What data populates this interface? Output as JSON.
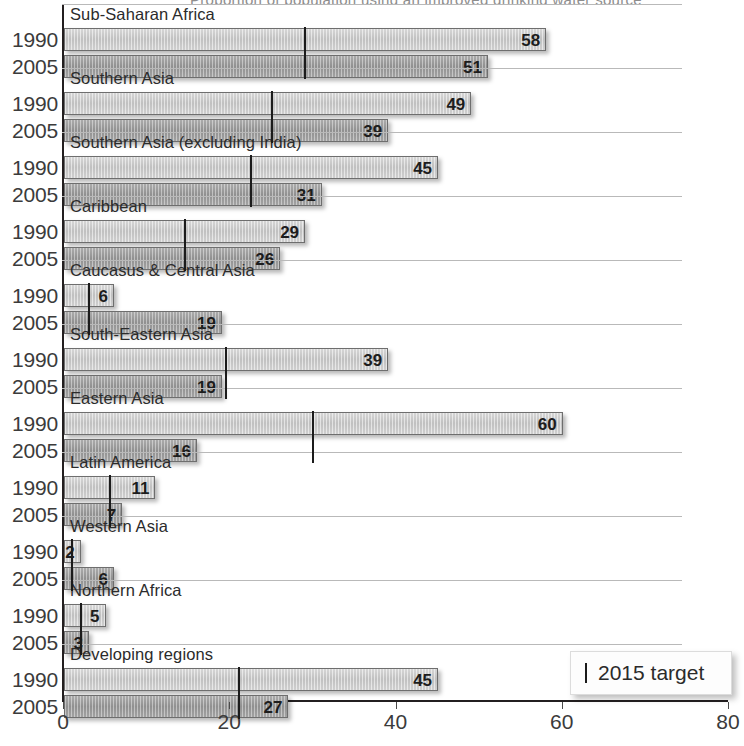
{
  "clipped_header": "Proportion of population using an improved drinking water source",
  "legend": {
    "marker_name": "target-marker",
    "label": "2015 target"
  },
  "axis": {
    "ticks": [
      0,
      20,
      40,
      60,
      80
    ],
    "tick_labels": [
      "0",
      "20",
      "40",
      "60",
      "80"
    ],
    "min": 0,
    "max": 80
  },
  "series_labels": {
    "first": "1990",
    "second": "2005"
  },
  "chart_data": {
    "type": "bar",
    "orientation": "horizontal",
    "title": "",
    "xlabel": "",
    "ylabel": "",
    "xlim": [
      0,
      80
    ],
    "grid": false,
    "legend_position": "bottom-right",
    "categories": [
      "Sub-Saharan Africa",
      "Southern Asia",
      "Southern Asia (excluding India)",
      "Caribbean",
      "Caucasus & Central Asia",
      "South-Eastern Asia",
      "Eastern Asia",
      "Latin America",
      "Western Asia",
      "Northern Africa",
      "Developing regions"
    ],
    "series": [
      {
        "name": "1990",
        "values": [
          58,
          49,
          45,
          29,
          6,
          39,
          60,
          11,
          2,
          5,
          45
        ]
      },
      {
        "name": "2005",
        "values": [
          51,
          39,
          31,
          26,
          19,
          19,
          16,
          7,
          6,
          3,
          27
        ]
      }
    ],
    "targets": {
      "name": "2015 target",
      "values": [
        29,
        25,
        22.5,
        14.5,
        3,
        19.5,
        30,
        5.5,
        1,
        2,
        21
      ]
    }
  },
  "groups": [
    {
      "title": "Sub-Saharan Africa",
      "target": 29,
      "rows": [
        {
          "label": "1990",
          "value": 58,
          "series": "y1990"
        },
        {
          "label": "2005",
          "value": 51,
          "series": "y2005"
        }
      ]
    },
    {
      "title": "Southern Asia",
      "target": 25,
      "rows": [
        {
          "label": "1990",
          "value": 49,
          "series": "y1990"
        },
        {
          "label": "2005",
          "value": 39,
          "series": "y2005"
        }
      ]
    },
    {
      "title": "Southern Asia (excluding India)",
      "target": 22.5,
      "rows": [
        {
          "label": "1990",
          "value": 45,
          "series": "y1990"
        },
        {
          "label": "2005",
          "value": 31,
          "series": "y2005"
        }
      ]
    },
    {
      "title": "Caribbean",
      "target": 14.5,
      "rows": [
        {
          "label": "1990",
          "value": 29,
          "series": "y1990"
        },
        {
          "label": "2005",
          "value": 26,
          "series": "y2005"
        }
      ]
    },
    {
      "title": "Caucasus & Central Asia",
      "target": 3,
      "rows": [
        {
          "label": "1990",
          "value": 6,
          "series": "y1990"
        },
        {
          "label": "2005",
          "value": 19,
          "series": "y2005"
        }
      ]
    },
    {
      "title": "South-Eastern Asia",
      "target": 19.5,
      "rows": [
        {
          "label": "1990",
          "value": 39,
          "series": "y1990"
        },
        {
          "label": "2005",
          "value": 19,
          "series": "y2005"
        }
      ]
    },
    {
      "title": "Eastern Asia",
      "target": 30,
      "rows": [
        {
          "label": "1990",
          "value": 60,
          "series": "y1990"
        },
        {
          "label": "2005",
          "value": 16,
          "series": "y2005"
        }
      ]
    },
    {
      "title": "Latin America",
      "target": 5.5,
      "rows": [
        {
          "label": "1990",
          "value": 11,
          "series": "y1990"
        },
        {
          "label": "2005",
          "value": 7,
          "series": "y2005"
        }
      ]
    },
    {
      "title": "Western Asia",
      "target": 1,
      "rows": [
        {
          "label": "1990",
          "value": 2,
          "series": "y1990"
        },
        {
          "label": "2005",
          "value": 6,
          "series": "y2005"
        }
      ]
    },
    {
      "title": "Northern Africa",
      "target": 2,
      "rows": [
        {
          "label": "1990",
          "value": 5,
          "series": "y1990"
        },
        {
          "label": "2005",
          "value": 3,
          "series": "y2005"
        }
      ]
    },
    {
      "title": "Developing regions",
      "target": 21,
      "rows": [
        {
          "label": "1990",
          "value": 45,
          "series": "y1990"
        },
        {
          "label": "2005",
          "value": 27,
          "series": "y2005"
        }
      ]
    }
  ]
}
